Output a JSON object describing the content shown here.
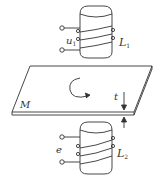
{
  "diagram": {
    "coil_top": {
      "label": "L",
      "label_sub": "1",
      "voltage": "u",
      "voltage_sub": "1"
    },
    "coil_bottom": {
      "label": "L",
      "label_sub": "2",
      "voltage": "e"
    },
    "plate": {
      "label": "M"
    },
    "thickness": {
      "label": "t"
    },
    "colors": {
      "stroke": "#333333",
      "background": "#ffffff"
    }
  }
}
